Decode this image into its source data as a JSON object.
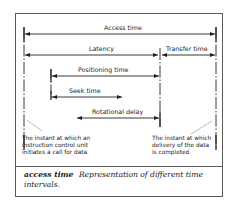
{
  "diagram": {
    "intervals": [
      {
        "label": "Access time",
        "from": "call",
        "to": "delivery-complete"
      },
      {
        "label": "Latency",
        "from": "call",
        "to": "transfer-start"
      },
      {
        "label": "Transfer time",
        "from": "transfer-start",
        "to": "delivery-complete"
      },
      {
        "label": "Positioning time",
        "from": "positioning-start",
        "to": "transfer-start"
      },
      {
        "label": "Seek time",
        "from": "positioning-start",
        "to": "seek-end"
      },
      {
        "label": "Rotational delay",
        "from": "seek-end",
        "to": "transfer-start"
      }
    ],
    "notes": {
      "left": [
        "The instant at which an",
        "instruction control unit",
        "initiates a call for data"
      ],
      "right": [
        "The instant at which",
        "delivery of the data",
        "is completed"
      ]
    }
  },
  "caption": {
    "term": "access time",
    "text": "Representation of different time intervals."
  }
}
